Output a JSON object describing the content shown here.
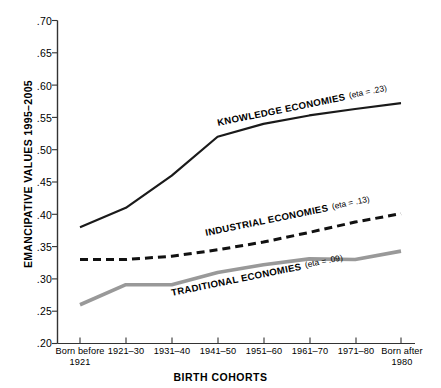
{
  "chart_data": {
    "type": "line",
    "title": "",
    "xlabel": "BIRTH COHORTS",
    "ylabel": "EMANCIPATIVE VALUES 1995–2005",
    "ylim": [
      0.2,
      0.7
    ],
    "yticks": [
      ".20",
      ".25",
      ".30",
      ".35",
      ".40",
      ".45",
      ".50",
      ".55",
      ".60",
      ".65",
      ".70"
    ],
    "ytick_values": [
      0.2,
      0.25,
      0.3,
      0.35,
      0.4,
      0.45,
      0.5,
      0.55,
      0.6,
      0.65,
      0.7
    ],
    "grid": false,
    "legend": "inline-annotations",
    "categories": [
      "Born before\n1921",
      "1921–30",
      "1931–40",
      "1941–50",
      "1951–60",
      "1961–70",
      "1971–80",
      "Born after\n1980"
    ],
    "series": [
      {
        "name": "KNOWLEDGE ECONOMIES",
        "eta": "(eta = .23)",
        "annotation": "KNOWLEDGE ECONOMIES",
        "style": "solid",
        "color": "#1a1a1a",
        "width": 2.2,
        "values": [
          0.38,
          0.41,
          0.46,
          0.52,
          0.54,
          0.553,
          0.563,
          0.572
        ]
      },
      {
        "name": "INDUSTRIAL ECONOMIES",
        "eta": "(eta = .13)",
        "annotation": "INDUSTRIAL ECONOMIES",
        "style": "dashed",
        "color": "#111111",
        "width": 3.0,
        "values": [
          0.33,
          0.33,
          0.335,
          0.345,
          0.357,
          0.372,
          0.388,
          0.401
        ]
      },
      {
        "name": "TRADITIONAL ECONOMIES",
        "eta": "(eta = .09)",
        "annotation": "TRADITIONAL ECONOMIES",
        "style": "solid",
        "color": "#999999",
        "width": 3.6,
        "values": [
          0.26,
          0.291,
          0.291,
          0.31,
          0.322,
          0.331,
          0.33,
          0.343
        ]
      }
    ]
  },
  "axis": {
    "y_title": "EMANCIPATIVE VALUES 1995–2005",
    "x_title": "BIRTH COHORTS",
    "ytick_0": ".70",
    "ytick_1": ".65",
    "ytick_2": ".60",
    "ytick_3": ".55",
    "ytick_4": ".50",
    "ytick_5": ".45",
    "ytick_6": ".40",
    "ytick_7": ".35",
    "ytick_8": ".30",
    "ytick_9": ".25",
    "ytick_10": ".20"
  },
  "xlabels": {
    "c0": "Born before\n1921",
    "c1": "1921–30",
    "c2": "1931–40",
    "c3": "1941–50",
    "c4": "1951–60",
    "c5": "1961–70",
    "c6": "1971–80",
    "c7": "Born after\n1980"
  },
  "annotations": {
    "knowledge_label": "KNOWLEDGE ECONOMIES",
    "knowledge_eta": "(eta = .23)",
    "industrial_label": "INDUSTRIAL ECONOMIES",
    "industrial_eta": "(eta = .13)",
    "traditional_label": "TRADITIONAL ECONOMIES",
    "traditional_eta": "(eta = .09)"
  },
  "colors": {
    "knowledge": "#1a1a1a",
    "industrial": "#111111",
    "traditional": "#999999",
    "axis": "#333333"
  }
}
